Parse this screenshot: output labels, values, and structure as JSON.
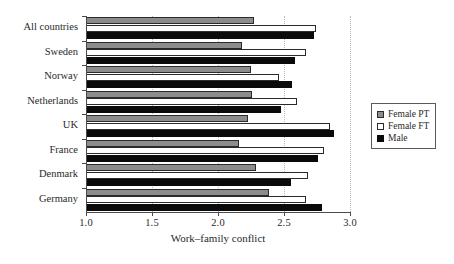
{
  "chart_data": {
    "type": "bar",
    "orientation": "horizontal",
    "title": "",
    "xlabel": "Work–family conflict",
    "ylabel": "",
    "xlim": [
      1.0,
      3.0
    ],
    "xticks": [
      "1.0",
      "1.5",
      "2.0",
      "2.5",
      "3.0"
    ],
    "xtick_values": [
      1.0,
      1.5,
      2.0,
      2.5,
      3.0
    ],
    "grid": "vertical-dotted",
    "legend_position": "right",
    "categories": [
      "All countries",
      "Sweden",
      "Norway",
      "Netherlands",
      "UK",
      "France",
      "Denmark",
      "Germany"
    ],
    "series": [
      {
        "name": "Female PT",
        "color": "#8c8c8c",
        "values": [
          2.27,
          2.18,
          2.25,
          2.26,
          2.23,
          2.16,
          2.29,
          2.39
        ]
      },
      {
        "name": "Female FT",
        "color": "#ffffff",
        "values": [
          2.74,
          2.67,
          2.46,
          2.6,
          2.85,
          2.8,
          2.68,
          2.67
        ]
      },
      {
        "name": "Male",
        "color": "#0a0a0a",
        "values": [
          2.73,
          2.58,
          2.56,
          2.48,
          2.88,
          2.76,
          2.55,
          2.79
        ]
      }
    ]
  },
  "legend": {
    "items": [
      {
        "label": "Female PT",
        "swatch": "pt"
      },
      {
        "label": "Female FT",
        "swatch": "ft"
      },
      {
        "label": "Male",
        "swatch": "male"
      }
    ]
  }
}
